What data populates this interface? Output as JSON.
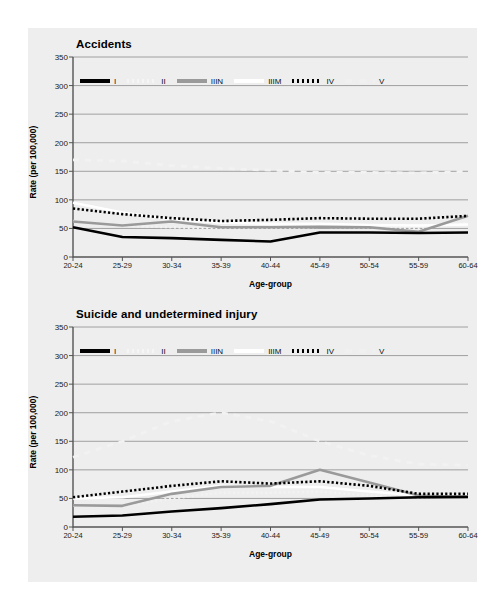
{
  "page": {
    "background_color": "#ffffff",
    "panel_color": "#eeeeee"
  },
  "colors": {
    "series_I": "#000000",
    "series_II": "#f2f2f2",
    "series_IIIN": "#9a9a9a",
    "series_IIIM": "#ffffff",
    "series_IV": "#000000",
    "series_V": "#f2f2f2",
    "grid": "#8c8c8c",
    "axis": "#555555",
    "text": "#111111"
  },
  "legend": {
    "items": [
      {
        "label": "I",
        "style": "solid",
        "color": "#000000",
        "width": 3.2
      },
      {
        "label": "II",
        "style": "dotted",
        "color": "#f5f5f5",
        "width": 3.2
      },
      {
        "label": "IIIN",
        "style": "solid",
        "color": "#9a9a9a",
        "width": 3.2
      },
      {
        "label": "IIIM",
        "style": "solid",
        "color": "#ffffff",
        "width": 3.2
      },
      {
        "label": "IV",
        "style": "dotted",
        "color": "#000000",
        "width": 3.2
      },
      {
        "label": "V",
        "style": "dashed",
        "color": "#f0f0f0",
        "width": 3.2
      }
    ]
  },
  "chart_data": [
    {
      "id": "accidents",
      "type": "line",
      "title": "Accidents",
      "xlabel": "Age-group",
      "ylabel": "Rate (per 100,000)",
      "categories": [
        "20-24",
        "25-29",
        "30-34",
        "35-39",
        "40-44",
        "45-49",
        "50-54",
        "55-59",
        "60-64"
      ],
      "ylim": [
        0,
        350
      ],
      "yticks": [
        0,
        50,
        100,
        150,
        200,
        250,
        300,
        350
      ],
      "grid": true,
      "legend_position": "top-inside",
      "series": [
        {
          "name": "I",
          "values": [
            52,
            35,
            33,
            30,
            27,
            43,
            43,
            42,
            43
          ]
        },
        {
          "name": "II",
          "values": [
            63,
            55,
            52,
            50,
            50,
            53,
            52,
            50,
            60
          ]
        },
        {
          "name": "IIIN",
          "values": [
            62,
            55,
            62,
            52,
            52,
            53,
            52,
            44,
            72
          ]
        },
        {
          "name": "IIIM",
          "values": [
            95,
            78,
            66,
            60,
            58,
            58,
            56,
            55,
            57
          ]
        },
        {
          "name": "IV",
          "values": [
            85,
            75,
            68,
            63,
            65,
            68,
            67,
            67,
            72
          ]
        },
        {
          "name": "V",
          "values": [
            170,
            168,
            160,
            155,
            152,
            148,
            148,
            147,
            150
          ]
        }
      ]
    },
    {
      "id": "suicide",
      "type": "line",
      "title": "Suicide and undetermined injury",
      "xlabel": "Age-group",
      "ylabel": "Rate (per 100,000)",
      "categories": [
        "20-24",
        "25-29",
        "30-34",
        "35-39",
        "40-44",
        "45-49",
        "50-54",
        "55-59",
        "60-64"
      ],
      "ylim": [
        0,
        350
      ],
      "yticks": [
        0,
        50,
        100,
        150,
        200,
        250,
        300,
        350
      ],
      "grid": true,
      "legend_position": "top-inside",
      "series": [
        {
          "name": "I",
          "values": [
            18,
            20,
            27,
            33,
            40,
            48,
            50,
            52,
            53
          ]
        },
        {
          "name": "II",
          "values": [
            38,
            36,
            50,
            60,
            60,
            62,
            55,
            52,
            55
          ]
        },
        {
          "name": "IIIN",
          "values": [
            38,
            37,
            58,
            70,
            72,
            100,
            78,
            55,
            52
          ]
        },
        {
          "name": "IIIM",
          "values": [
            50,
            52,
            62,
            72,
            70,
            70,
            62,
            55,
            55
          ]
        },
        {
          "name": "IV",
          "values": [
            52,
            62,
            72,
            80,
            76,
            80,
            72,
            58,
            58
          ]
        },
        {
          "name": "V",
          "values": [
            122,
            150,
            185,
            200,
            185,
            150,
            125,
            110,
            108
          ]
        }
      ]
    }
  ]
}
